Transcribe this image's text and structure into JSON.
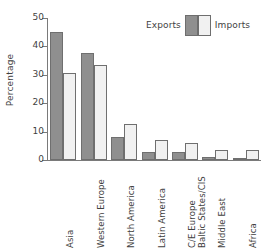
{
  "chart_data": {
    "type": "bar",
    "title": "",
    "xlabel": "",
    "ylabel": "Percentage",
    "ylim": [
      0,
      50
    ],
    "yticks": [
      0,
      10,
      20,
      30,
      40,
      50
    ],
    "ytick_labels": [
      "0",
      "10",
      "20",
      "30",
      "40",
      "50"
    ],
    "grid": false,
    "legend_position": "top-right",
    "categories": [
      "Asia",
      "Western Europe",
      "North America",
      "Latin America",
      "C/E Europe Baltic States/CIS",
      "Middle East",
      "Africa"
    ],
    "category_lines": [
      [
        "Asia"
      ],
      [
        "Western Europe"
      ],
      [
        "North America"
      ],
      [
        "Latin America"
      ],
      [
        "C/E Europe",
        "Baltic States/CIS"
      ],
      [
        "Middle East"
      ],
      [
        "Africa"
      ]
    ],
    "series": [
      {
        "name": "Exports",
        "color": "#8f8f8f",
        "values": [
          45.2,
          37.6,
          8.0,
          2.7,
          2.8,
          1.1,
          0.5
        ]
      },
      {
        "name": "Imports",
        "color": "#f1f1f1",
        "values": [
          30.6,
          33.4,
          12.7,
          7.0,
          6.1,
          3.5,
          3.5
        ]
      }
    ]
  },
  "legend": {
    "exports_label": "Exports",
    "imports_label": "Imports"
  },
  "axis": {
    "y_title": "Percentage"
  }
}
